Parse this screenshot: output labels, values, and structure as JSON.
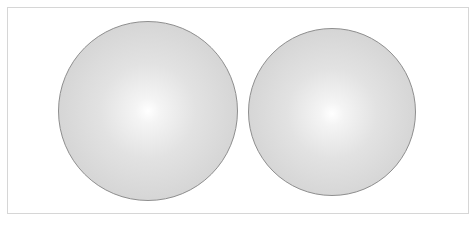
{
  "scene": {
    "frame": {
      "border_color": "#d6d6d6",
      "background": "#ffffff"
    },
    "spheres": [
      {
        "label": "left-sphere",
        "cx": 148,
        "cy": 111,
        "diameter": 180,
        "highlight_x": "50%",
        "highlight_y": "50%",
        "colors": {
          "highlight": "#ffffff",
          "mid": "#e2e2e2",
          "edge": "#c8c8c8",
          "outline": "#8e8e8e"
        }
      },
      {
        "label": "right-sphere",
        "cx": 332,
        "cy": 112,
        "diameter": 168,
        "highlight_x": "50%",
        "highlight_y": "51%",
        "colors": {
          "highlight": "#ffffff",
          "mid": "#e2e2e2",
          "edge": "#c8c8c8",
          "outline": "#8e8e8e"
        }
      }
    ]
  }
}
